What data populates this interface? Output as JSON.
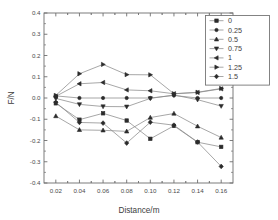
{
  "chart_data": {
    "type": "line",
    "title": "",
    "subtitle": "",
    "xlabel": "Distance/m",
    "ylabel": "F/N",
    "xlim": [
      0.01,
      0.17
    ],
    "ylim": [
      -0.4,
      0.4
    ],
    "xticks": [
      0.02,
      0.04,
      0.06,
      0.08,
      0.1,
      0.12,
      0.14,
      0.16
    ],
    "xticklabels": [
      "0.02",
      "0.04",
      "0.06",
      "0.08",
      "0.10",
      "0.12",
      "0.14",
      "0.16"
    ],
    "yticks": [
      -0.4,
      -0.3,
      -0.2,
      -0.1,
      0.0,
      0.1,
      0.2,
      0.3,
      0.4
    ],
    "yticklabels": [
      "-0.4",
      "-0.3",
      "-0.2",
      "-0.1",
      "0.0",
      "0.1",
      "0.2",
      "0.3",
      "0.4"
    ],
    "grid": false,
    "minor_ticks": true,
    "legend_position": "upper right",
    "line_color": "#8a8a8a",
    "marker_color": "#2b2b2b",
    "frame_color": "#6e6e6e",
    "x": [
      0.02,
      0.04,
      0.06,
      0.08,
      0.1,
      0.12,
      0.14,
      0.16
    ],
    "series": [
      {
        "name": "0",
        "marker": "square",
        "values": [
          -0.025,
          -0.102,
          -0.072,
          -0.106,
          -0.192,
          -0.131,
          -0.208,
          -0.23
        ]
      },
      {
        "name": "0.25",
        "marker": "circle",
        "values": [
          0.01,
          0.0,
          0.0,
          0.0,
          0.0,
          0.012,
          0.0,
          0.0
        ]
      },
      {
        "name": "0.5",
        "marker": "triangle-up",
        "values": [
          -0.085,
          -0.15,
          -0.152,
          -0.157,
          -0.092,
          -0.073,
          -0.133,
          -0.186
        ]
      },
      {
        "name": "0.75",
        "marker": "triangle-down",
        "values": [
          -0.002,
          -0.03,
          -0.04,
          -0.041,
          -0.002,
          0.014,
          -0.008,
          -0.038
        ]
      },
      {
        "name": "1",
        "marker": "triangle-left",
        "values": [
          0.008,
          0.067,
          0.073,
          0.038,
          0.034,
          0.02,
          0.026,
          0.043
        ]
      },
      {
        "name": "1.25",
        "marker": "triangle-right",
        "values": [
          0.012,
          0.114,
          0.158,
          0.11,
          0.109,
          0.02,
          0.027,
          0.045
        ]
      },
      {
        "name": "1.5",
        "marker": "diamond",
        "values": [
          -0.02,
          -0.115,
          -0.118,
          -0.212,
          -0.114,
          -0.128,
          -0.207,
          -0.322
        ]
      }
    ],
    "legend_entries": [
      {
        "label": "0",
        "marker": "square"
      },
      {
        "label": "0.25",
        "marker": "circle"
      },
      {
        "label": "0.5",
        "marker": "triangle-up"
      },
      {
        "label": "0.75",
        "marker": "triangle-down"
      },
      {
        "label": "1",
        "marker": "triangle-left"
      },
      {
        "label": "1.25",
        "marker": "triangle-right"
      },
      {
        "label": "1.5",
        "marker": "diamond"
      }
    ]
  }
}
